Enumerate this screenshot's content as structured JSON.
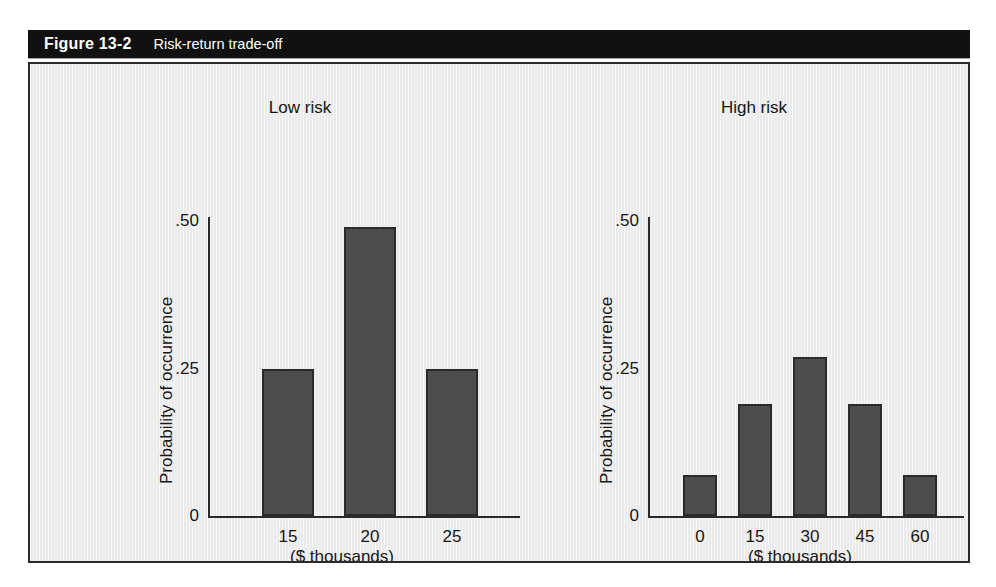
{
  "figure": {
    "number": "Figure 13-2",
    "caption": "Risk-return trade-off"
  },
  "colors": {
    "title_bar_bg": "#111111",
    "title_bar_text": "#ffffff",
    "panel_bg": "#eeeeee",
    "panel_border": "#2b2b2b",
    "bar_fill": "#4d4d4d",
    "bar_stroke": "#2a2a2a",
    "axis": "#2b2b2b",
    "text": "#161616"
  },
  "chart_data": [
    {
      "type": "bar",
      "title": "Low risk",
      "xlabel": "($ thousands)",
      "ylabel": "Probability of occurrence",
      "categories": [
        "15",
        "20",
        "25"
      ],
      "values": [
        0.25,
        0.49,
        0.25
      ],
      "ylim": [
        0,
        0.5
      ],
      "yticks": [
        0,
        0.25,
        0.5
      ],
      "ytick_labels": [
        "0",
        ".25",
        ".50"
      ],
      "grid": false,
      "legend": "none"
    },
    {
      "type": "bar",
      "title": "High risk",
      "xlabel": "($ thousands)",
      "ylabel": "Probability of occurrence",
      "categories": [
        "0",
        "15",
        "30",
        "45",
        "60"
      ],
      "values": [
        0.07,
        0.19,
        0.27,
        0.19,
        0.07
      ],
      "ylim": [
        0,
        0.5
      ],
      "yticks": [
        0,
        0.25,
        0.5
      ],
      "ytick_labels": [
        "0",
        ".25",
        ".50"
      ],
      "grid": false,
      "legend": "none"
    }
  ]
}
